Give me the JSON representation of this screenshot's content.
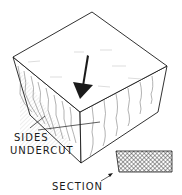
{
  "figure": {
    "labels": {
      "sides": "SIDES",
      "undercut": "UNDERCUT",
      "section": "SECTION"
    },
    "colors": {
      "ink": "#1a1a1a",
      "paper": "#ffffff",
      "hatch": "#555555"
    }
  }
}
